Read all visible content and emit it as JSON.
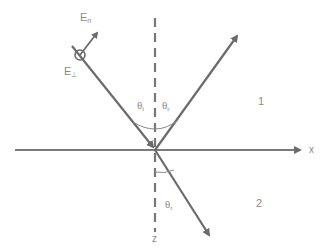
{
  "diagram": {
    "colors": {
      "ray": "#6b6b6b",
      "axis": "#7a7a7a",
      "label": "#8a8a8a",
      "background": "#ffffff"
    },
    "axes": {
      "x_label": "x",
      "z_label": "z"
    },
    "regions": {
      "medium_1": "1",
      "medium_2": "2"
    },
    "angles": {
      "incident": {
        "symbol": "θ",
        "sub": "i"
      },
      "reflected": {
        "symbol": "θ",
        "sub": "r"
      },
      "transmitted": {
        "symbol": "θ",
        "sub": "t"
      }
    },
    "fields": {
      "e_normal": {
        "symbol": "E",
        "sub": "n"
      },
      "e_perp": {
        "symbol": "E",
        "sub": "⊥"
      }
    },
    "rays": [
      "incident",
      "reflected",
      "transmitted"
    ]
  }
}
